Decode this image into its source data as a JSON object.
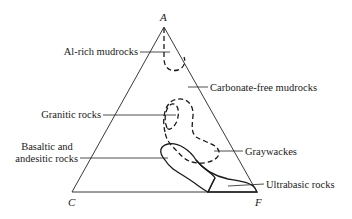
{
  "diagram": {
    "type": "ACF ternary diagram",
    "vertices": {
      "top": "A",
      "bottom_left": "C",
      "bottom_right": "F"
    },
    "fields": [
      {
        "label": "Al-rich mudrocks",
        "line_style": "dashed"
      },
      {
        "label": "Carbonate-free mudrocks",
        "line_style": "none"
      },
      {
        "label": "Granitic rocks",
        "line_style": "dashed"
      },
      {
        "label": "Graywackes",
        "line_style": "dashed"
      },
      {
        "label": "Basaltic and andesitic rocks",
        "line_style": "solid"
      },
      {
        "label": "Ultrabasic rocks",
        "line_style": "solid"
      }
    ],
    "labels": {
      "al_rich": "Al-rich mudrocks",
      "carbonate_free": "Carbonate-free mudrocks",
      "granitic": "Granitic rocks",
      "basaltic_line1": "Basaltic and",
      "basaltic_line2": "andesitic rocks",
      "graywackes": "Graywackes",
      "ultrabasic": "Ultrabasic rocks"
    }
  }
}
